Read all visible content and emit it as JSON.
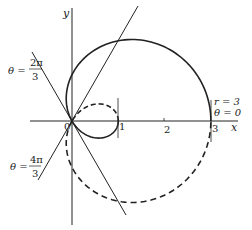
{
  "figure": {
    "equation": "r = 1 + 2cos θ",
    "axes": {
      "x_label": "x",
      "y_label": "y",
      "origin_label": "0",
      "ticks": [
        "1",
        "2",
        "3"
      ]
    },
    "annotations": {
      "theta_2pi3": {
        "theta": "θ =",
        "num": "2π",
        "den": "3"
      },
      "theta_4pi3": {
        "theta": "θ =",
        "num": "4π",
        "den": "3"
      },
      "r3": "r = 3",
      "theta0": "θ = 0"
    },
    "colors": {
      "line": "#222222",
      "background": "#ffffff"
    }
  }
}
